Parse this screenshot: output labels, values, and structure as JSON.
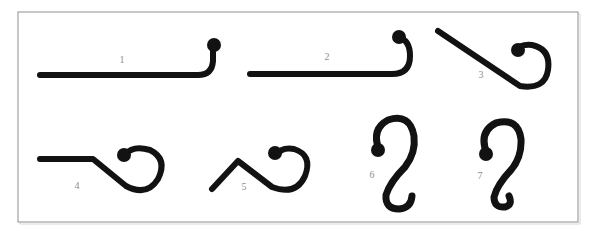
{
  "figure": {
    "background_color": "#ffffff",
    "frame": {
      "border_color": "#9a9a9a",
      "shadow_color": "#d8d8d8",
      "x": 18,
      "y": 12,
      "width": 560,
      "height": 210
    },
    "stroke_color": "#121212",
    "label_color": "#8d8d8d",
    "shapes": [
      {
        "id": "shape-1",
        "label": "1",
        "description": "straight horizontal rod with short upward hook ending in a ball",
        "label_x": 122,
        "label_y": 61,
        "stroke_width": 6,
        "path": "M 40 75 L 198 75 Q 212 75 213 61 L 213 50",
        "ball": {
          "cx": 214,
          "cy": 45,
          "r": 7
        }
      },
      {
        "id": "shape-2",
        "label": "2",
        "description": "straight horizontal rod ending in a J hook curving up and back to the left with a ball tip",
        "label_x": 327,
        "label_y": 58,
        "stroke_width": 6,
        "path": "M 250 74 L 392 74 Q 410 74 410 56 Q 410 40 399 38",
        "ball": {
          "cx": 399,
          "cy": 37,
          "r": 7
        }
      },
      {
        "id": "shape-3",
        "label": "3",
        "description": "long diagonal rod descending to the right into a round closed hook with a ball tip",
        "label_x": 481,
        "label_y": 76,
        "stroke_width": 6,
        "path": "M 438 31 L 520 86 Q 545 90 548 70 Q 551 49 532 45 Q 520 44 517 50",
        "ball": {
          "cx": 518,
          "cy": 50,
          "r": 7
        }
      },
      {
        "id": "shape-4",
        "label": "4",
        "description": "horizontal rod with a bend descending right into a circular hook with a ball tip",
        "label_x": 77,
        "label_y": 187,
        "stroke_width": 6,
        "path": "M 40 159 L 93 159 L 126 186 Q 147 197 158 179 Q 168 159 150 150 Q 133 145 126 154",
        "ball": {
          "cx": 124,
          "cy": 155,
          "r": 7
        }
      },
      {
        "id": "shape-5",
        "label": "5",
        "description": "zigzag rod rising then descending into a circular hook with a ball tip",
        "label_x": 244,
        "label_y": 188,
        "stroke_width": 6,
        "path": "M 212 189 L 238 161 L 272 187 Q 296 196 305 176 Q 313 155 294 149 Q 281 147 277 155",
        "ball": {
          "cx": 275,
          "cy": 153,
          "r": 7
        }
      },
      {
        "id": "shape-6",
        "label": "6",
        "description": "open S shaped hook, ball tip at upper left, large upper arc and lower sweeping hook",
        "label_x": 372,
        "label_y": 176,
        "stroke_width": 7,
        "path": "M 379 150 Q 371 129 388 120 Q 410 113 414 136 Q 416 153 405 167 Q 390 182 386 195 Q 385 209 399 209 Q 411 208 412 196",
        "ball": {
          "cx": 378,
          "cy": 150,
          "r": 7
        }
      },
      {
        "id": "shape-7",
        "label": "7",
        "description": "tight S shaped hook, ball tip at upper left, lower end curled into a small closed loop",
        "label_x": 480,
        "label_y": 177,
        "stroke_width": 7,
        "path": "M 487 154 Q 478 132 496 123 Q 518 117 521 139 Q 522 157 511 170 Q 497 185 494 197 Q 494 208 505 207 Q 513 205 509 196",
        "ball": {
          "cx": 486,
          "cy": 154,
          "r": 7
        }
      }
    ]
  }
}
